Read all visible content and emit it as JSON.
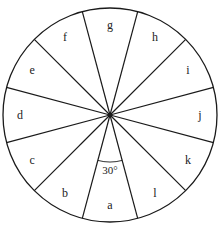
{
  "diagram": {
    "type": "sectored-wheel",
    "sector_count": 12,
    "sector_angle_label": "30°",
    "sector_labels": [
      "a",
      "b",
      "c",
      "d",
      "e",
      "f",
      "g",
      "h",
      "i",
      "j",
      "k",
      "l"
    ],
    "colors": {
      "stroke": "#1a1a1a",
      "background": "#ffffff"
    }
  }
}
